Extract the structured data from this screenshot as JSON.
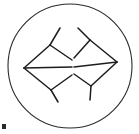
{
  "figure": {
    "background_color": "#ffffff",
    "stroke_color": "#1d1d1d",
    "circle_stroke_color": "#2b2b2b",
    "ink_mark_color": "#2a2a2a",
    "canvas": {
      "width": 139,
      "height": 134
    },
    "enclosing_circle": {
      "cx": 70,
      "cy": 66,
      "r": 62,
      "stroke_width": 1.1
    },
    "stroke_width": 1.5,
    "strokes": [
      {
        "name": "left-arrow-upper-head",
        "points": "24,68 50,45"
      },
      {
        "name": "left-arrow-lower-head",
        "points": "24,68 51,90"
      },
      {
        "name": "left-arrow-shaft",
        "points": "24,68 72,67"
      },
      {
        "name": "left-upper-fin",
        "points": "50,45 60,28"
      },
      {
        "name": "left-upper-inner-fin",
        "points": "50,45 72,60"
      },
      {
        "name": "left-lower-fin",
        "points": "51,90 58,102"
      },
      {
        "name": "left-lower-inner-fin",
        "points": "51,90 72,75"
      },
      {
        "name": "right-arrow-upper-head",
        "points": "117,62 90,40"
      },
      {
        "name": "right-arrow-lower-head",
        "points": "117,62 91,86"
      },
      {
        "name": "right-arrow-shaft",
        "points": "117,62 74,67"
      },
      {
        "name": "right-upper-fin",
        "points": "90,40 78,28"
      },
      {
        "name": "right-upper-inner-fin",
        "points": "90,40 74,58"
      },
      {
        "name": "right-lower-fin",
        "points": "91,86 90,100"
      },
      {
        "name": "right-lower-inner-fin",
        "points": "91,86 74,74"
      }
    ],
    "ink_mark": {
      "x": 2,
      "y": 124,
      "width": 4,
      "height": 5
    }
  }
}
